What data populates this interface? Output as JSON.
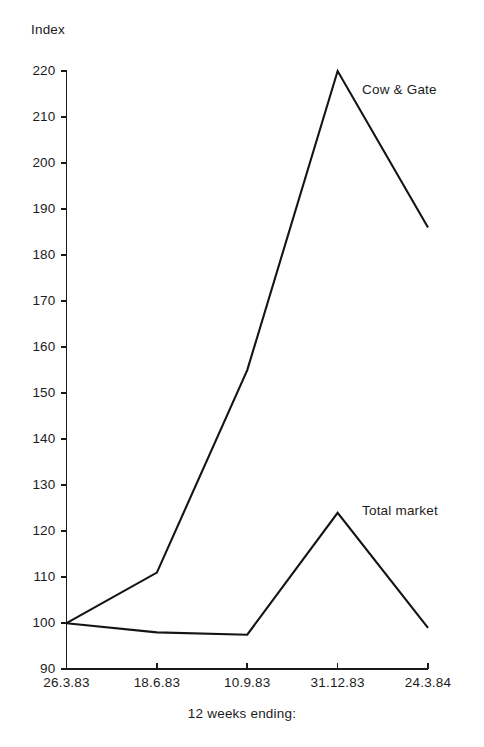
{
  "chart_data": {
    "type": "line",
    "title": "",
    "xlabel": "12 weeks ending:",
    "ylabel": "Index",
    "categories": [
      "26.3.83",
      "18.6.83",
      "10.9.83",
      "31.12.83",
      "24.3.84"
    ],
    "series": [
      {
        "name": "Cow & Gate",
        "values": [
          100,
          111,
          155,
          220,
          186
        ]
      },
      {
        "name": "Total market",
        "values": [
          100,
          98,
          97.5,
          124,
          99
        ]
      }
    ],
    "ylim": [
      90,
      220
    ],
    "ytick_step": 10,
    "yticks": [
      90,
      100,
      110,
      120,
      130,
      140,
      150,
      160,
      170,
      180,
      190,
      200,
      210,
      220
    ],
    "ytick_labels": [
      "90",
      "100",
      "110",
      "120",
      "130",
      "140",
      "150",
      "160",
      "170",
      "180",
      "190",
      "200",
      "210",
      "220"
    ],
    "grid": false,
    "legend_position": "inline-annotation",
    "annotations": [
      {
        "text": "Cow & Gate",
        "at_category": "31.12.83",
        "placement": "right-of-peak"
      },
      {
        "text": "Total market",
        "at_category": "31.12.83",
        "placement": "right-of-peak"
      }
    ],
    "line_color": "#141414",
    "background_color": "#ffffff"
  },
  "axes": {
    "y_title": "Index",
    "x_title": "12 weeks ending:"
  }
}
